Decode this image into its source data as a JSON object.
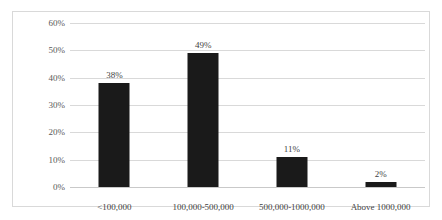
{
  "chart_data": {
    "type": "bar",
    "title": "",
    "subtitle": "",
    "xlabel": "",
    "ylabel": "",
    "categories": [
      "<100,000",
      "100,000-500,000",
      "500,000-1000,000",
      "Above 1000,000"
    ],
    "values": [
      38,
      49,
      11,
      2
    ],
    "data_labels": [
      "38%",
      "49%",
      "11%",
      "2%"
    ],
    "ylim": [
      0,
      60
    ],
    "y_ticks": [
      0,
      10,
      20,
      30,
      40,
      50,
      60
    ],
    "y_tick_labels": [
      "0%",
      "10%",
      "20%",
      "30%",
      "40%",
      "50%",
      "60%"
    ],
    "grid": true,
    "legend": false,
    "legend_position": "none",
    "series": [
      {
        "name": "",
        "values": [
          38,
          49,
          11,
          2
        ]
      }
    ],
    "colors": {
      "bar": "#1a1a1a",
      "gridline": "#d9d9d9",
      "border": "#d9d9d9",
      "axis_text": "#595959",
      "label_text": "#3f3f3f",
      "background": "#ffffff"
    }
  }
}
